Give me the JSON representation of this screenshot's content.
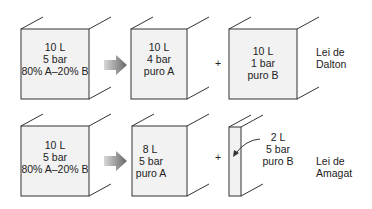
{
  "dalton": {
    "mixture": {
      "lines": [
        "10 L",
        "5 bar",
        "80% A–20% B"
      ]
    },
    "gas_a": {
      "lines": [
        "10 L",
        "4 bar",
        "puro A"
      ]
    },
    "gas_b": {
      "lines": [
        "10 L",
        "1 bar",
        "puro B"
      ]
    },
    "plus": "+",
    "law": {
      "lines": [
        "Lei de",
        "Dalton"
      ]
    }
  },
  "amagat": {
    "mixture": {
      "lines": [
        "10 L",
        "5 bar",
        "80% A–20% B"
      ]
    },
    "gas_a": {
      "lines": [
        "8 L",
        "5 bar",
        "puro A"
      ]
    },
    "gas_b": {
      "lines": [
        "2 L",
        "5 bar",
        "puro B"
      ]
    },
    "plus": "+",
    "law": {
      "lines": [
        "Lei de",
        "Amagat"
      ]
    }
  },
  "colors": {
    "face": "#f2f2f2",
    "stroke": "#333333",
    "arrow": "#8a8a8a"
  }
}
